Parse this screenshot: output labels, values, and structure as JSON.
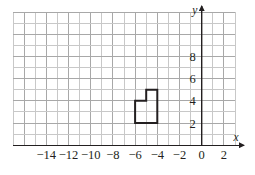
{
  "figure": {
    "kind": "coordinate-grid-plot",
    "background_color": "#ffffff",
    "grid": {
      "minor_line_color": "#c8c8c8",
      "major_line_color": "#a8a8a8",
      "cell_size_px": 11.1,
      "x_min": -17,
      "x_max": 3,
      "y_min": 0,
      "y_max": 12,
      "grid_on": true
    },
    "axes": {
      "axis_color": "#231f20",
      "x_axis_label": "x",
      "y_axis_label": "y",
      "x_axis_at_y": 0,
      "y_axis_at_x": 0,
      "x_tick_labels": [
        "−14",
        "−12",
        "−10",
        "−8",
        "−6",
        "−4",
        "−2",
        "0",
        "2"
      ],
      "x_tick_values": [
        -14,
        -12,
        -10,
        -8,
        -6,
        -4,
        -2,
        0,
        2
      ],
      "y_tick_labels": [
        "2",
        "4",
        "6",
        "8"
      ],
      "y_tick_values": [
        2,
        4,
        6,
        8
      ]
    }
  },
  "chart_data": {
    "type": "scatter",
    "title": "",
    "xlabel": "x",
    "ylabel": "y",
    "xlim": [
      -17,
      3
    ],
    "ylim": [
      0,
      12
    ],
    "grid": true,
    "legend": "none",
    "series": [
      {
        "name": "polygon",
        "kind": "closed-polygon",
        "stroke_color": "#231f20",
        "stroke_width_px": 2,
        "fill": "none",
        "vertices": [
          [
            -6,
            4
          ],
          [
            -5,
            4
          ],
          [
            -5,
            5
          ],
          [
            -4,
            5
          ],
          [
            -4,
            2
          ],
          [
            -6,
            2
          ]
        ],
        "vertex_labels": [
          "(−6, 4)",
          "(−5, 4)",
          "(−5, 5)",
          "(−4, 5)",
          "(−4, 2)",
          "(−6, 2)"
        ]
      }
    ]
  }
}
